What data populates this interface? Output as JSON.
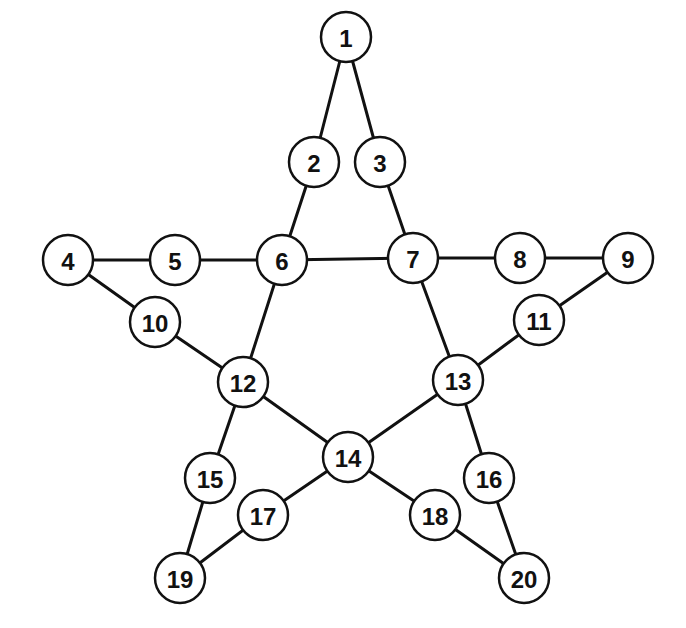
{
  "diagram": {
    "title": "",
    "node_radius": 25,
    "colors": {
      "stroke": "#111111",
      "fill": "#ffffff",
      "background": "#ffffff"
    },
    "nodes": [
      {
        "id": "1",
        "label": "1",
        "x": 346,
        "y": 37
      },
      {
        "id": "2",
        "label": "2",
        "x": 314,
        "y": 162
      },
      {
        "id": "3",
        "label": "3",
        "x": 380,
        "y": 162
      },
      {
        "id": "4",
        "label": "4",
        "x": 68,
        "y": 260
      },
      {
        "id": "5",
        "label": "5",
        "x": 175,
        "y": 260
      },
      {
        "id": "6",
        "label": "6",
        "x": 282,
        "y": 260
      },
      {
        "id": "7",
        "label": "7",
        "x": 413,
        "y": 258
      },
      {
        "id": "8",
        "label": "8",
        "x": 520,
        "y": 258
      },
      {
        "id": "9",
        "label": "9",
        "x": 628,
        "y": 258
      },
      {
        "id": "10",
        "label": "10",
        "x": 155,
        "y": 322
      },
      {
        "id": "11",
        "label": "11",
        "x": 539,
        "y": 320
      },
      {
        "id": "12",
        "label": "12",
        "x": 243,
        "y": 382
      },
      {
        "id": "13",
        "label": "13",
        "x": 458,
        "y": 380
      },
      {
        "id": "14",
        "label": "14",
        "x": 348,
        "y": 457
      },
      {
        "id": "15",
        "label": "15",
        "x": 210,
        "y": 478
      },
      {
        "id": "16",
        "label": "16",
        "x": 489,
        "y": 478
      },
      {
        "id": "17",
        "label": "17",
        "x": 263,
        "y": 515
      },
      {
        "id": "18",
        "label": "18",
        "x": 435,
        "y": 515
      },
      {
        "id": "19",
        "label": "19",
        "x": 180,
        "y": 578
      },
      {
        "id": "20",
        "label": "20",
        "x": 524,
        "y": 578
      }
    ],
    "edges": [
      [
        "1",
        "2"
      ],
      [
        "1",
        "3"
      ],
      [
        "2",
        "6"
      ],
      [
        "3",
        "7"
      ],
      [
        "4",
        "5"
      ],
      [
        "5",
        "6"
      ],
      [
        "6",
        "7"
      ],
      [
        "7",
        "8"
      ],
      [
        "8",
        "9"
      ],
      [
        "4",
        "10"
      ],
      [
        "10",
        "12"
      ],
      [
        "9",
        "11"
      ],
      [
        "11",
        "13"
      ],
      [
        "6",
        "12"
      ],
      [
        "7",
        "13"
      ],
      [
        "12",
        "14"
      ],
      [
        "13",
        "14"
      ],
      [
        "12",
        "15"
      ],
      [
        "15",
        "19"
      ],
      [
        "14",
        "17"
      ],
      [
        "17",
        "19"
      ],
      [
        "13",
        "16"
      ],
      [
        "16",
        "20"
      ],
      [
        "14",
        "18"
      ],
      [
        "18",
        "20"
      ]
    ]
  }
}
